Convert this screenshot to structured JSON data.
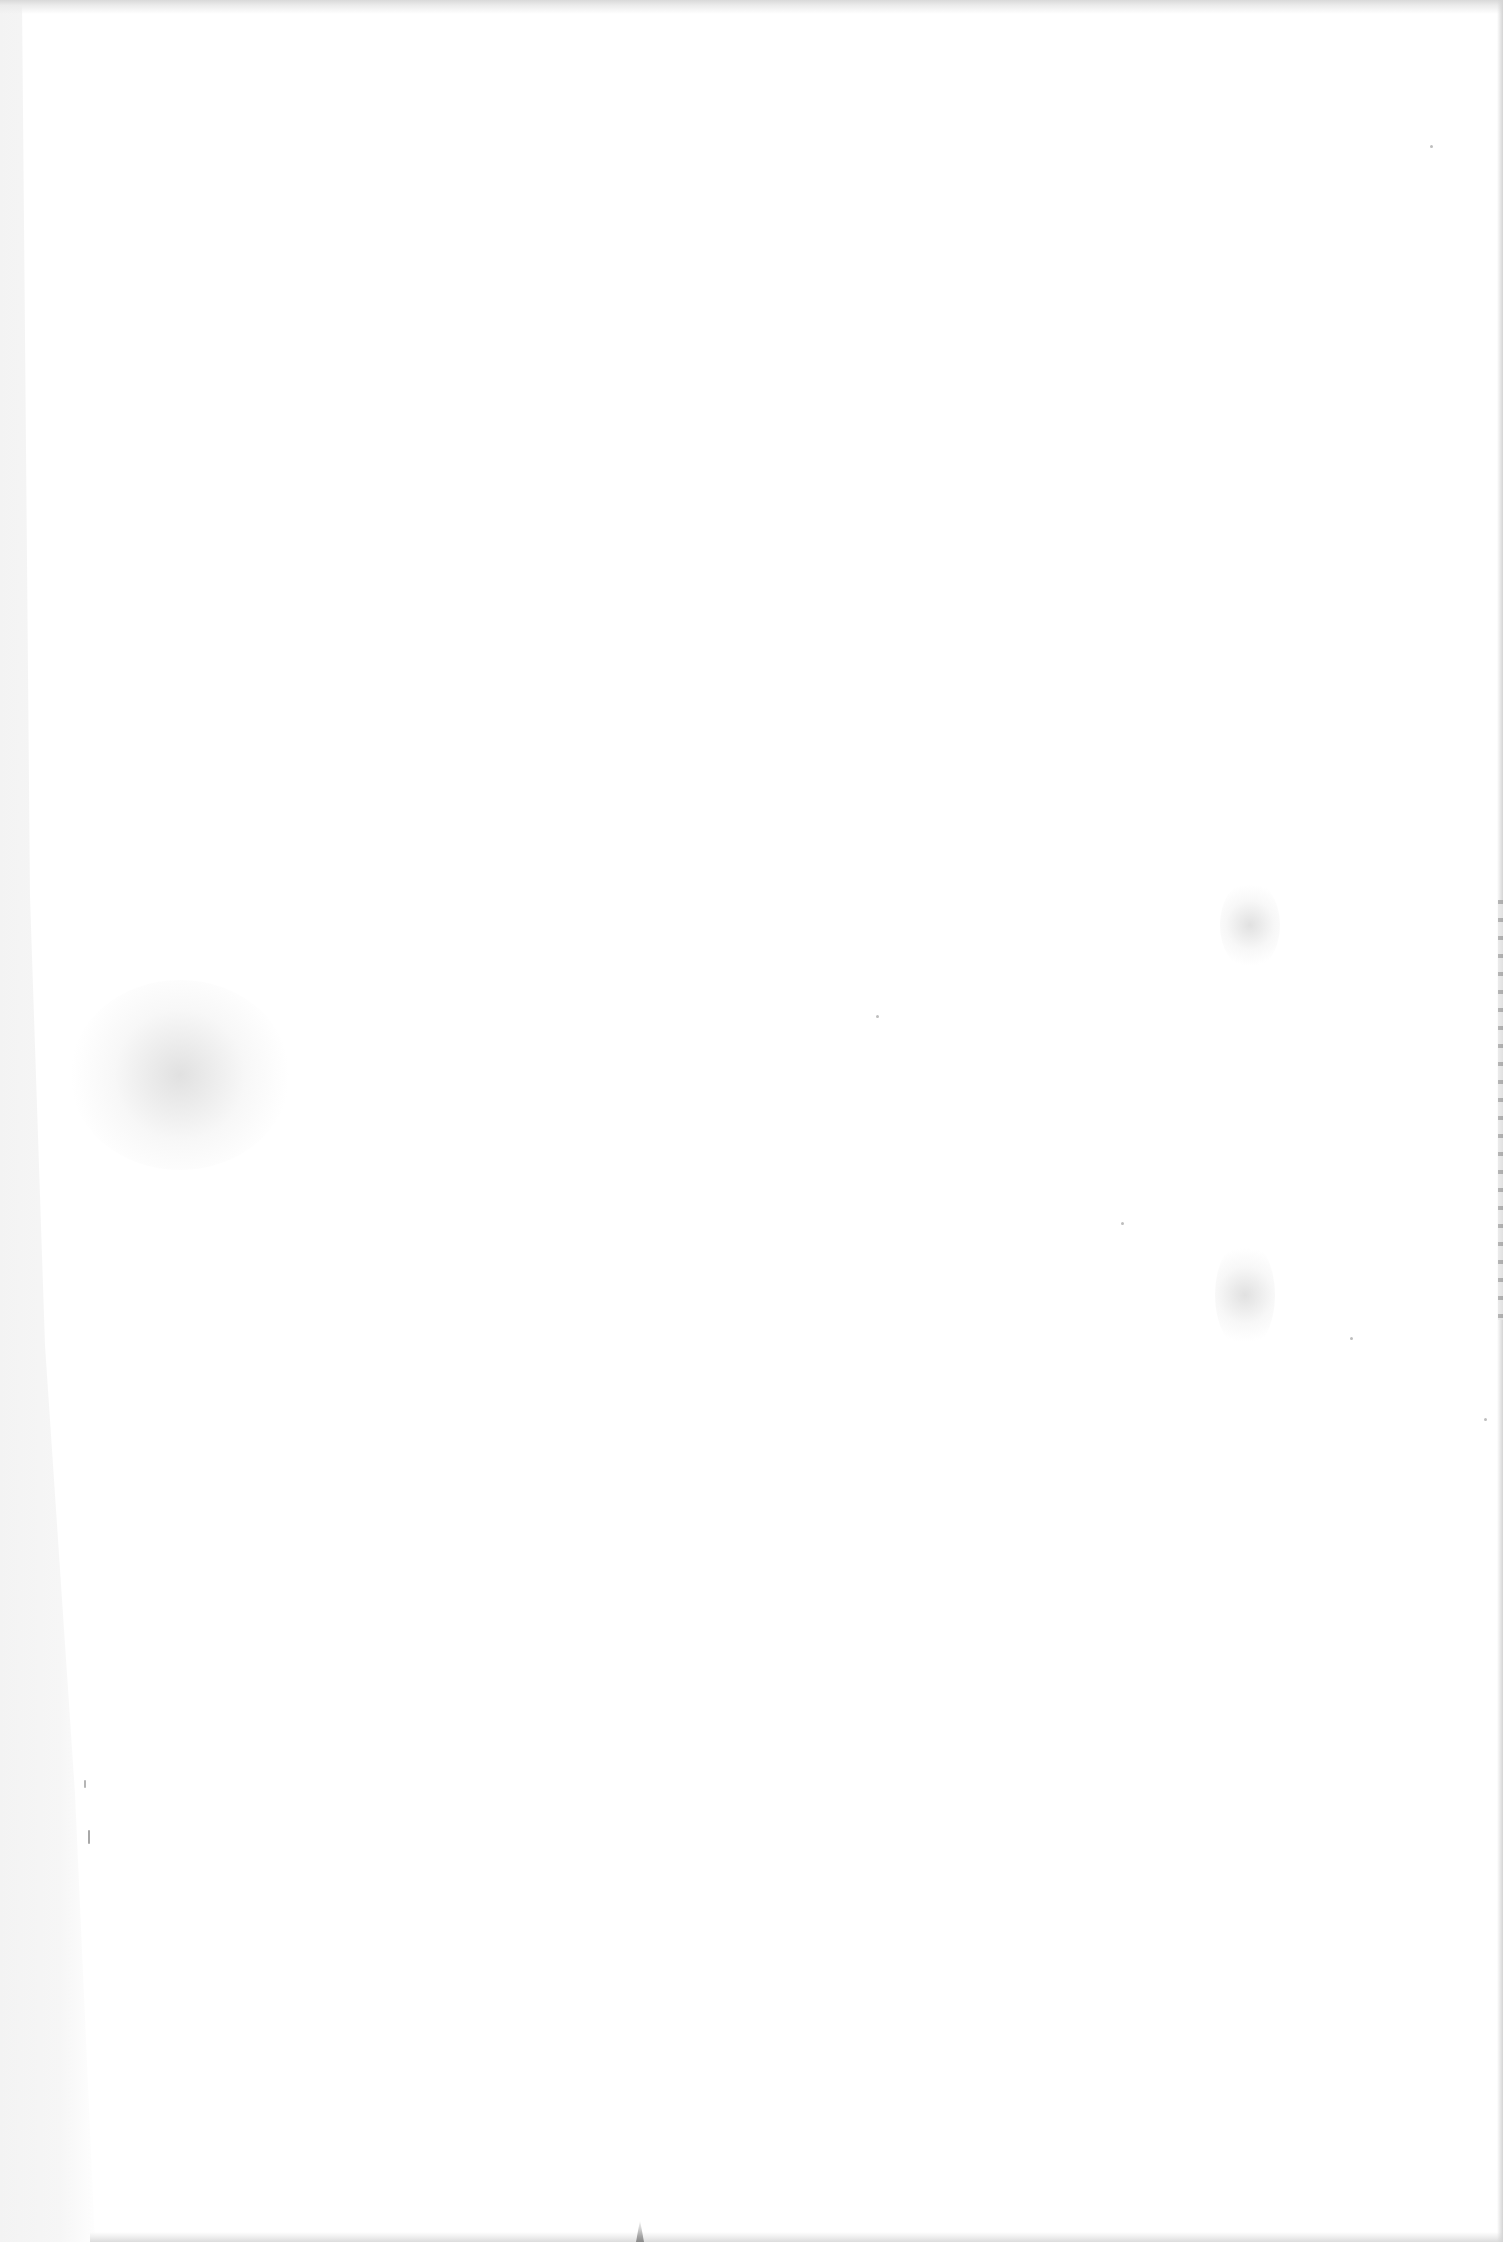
{
  "page": {
    "type": "blank-scanned-page",
    "text_content": [],
    "colors": {
      "paper": "#ffffff",
      "margin_band": "#f4f4f4",
      "scan_noise": "#bdbdbd"
    }
  }
}
